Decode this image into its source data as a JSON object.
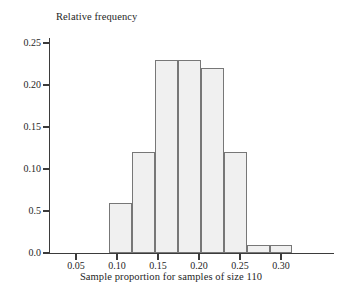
{
  "chart_data": {
    "type": "bar",
    "title": "",
    "xlabel": "Sample proportion for samples of size 110",
    "ylabel": "Relative frequency",
    "xlim": [
      0.035,
      0.318
    ],
    "ylim": [
      0.0,
      0.257
    ],
    "grid": false,
    "legend": null,
    "bin_width": 0.028,
    "bin_starts": [
      0.09,
      0.118,
      0.146,
      0.174,
      0.202,
      0.23,
      0.258,
      0.286
    ],
    "categories": [
      "0.090-0.118",
      "0.118-0.146",
      "0.146-0.174",
      "0.174-0.202",
      "0.202-0.230",
      "0.230-0.258",
      "0.258-0.286",
      "0.286-0.314"
    ],
    "values": [
      0.06,
      0.12,
      0.23,
      0.23,
      0.22,
      0.12,
      0.01,
      0.01
    ],
    "xticks": [
      0.05,
      0.1,
      0.15,
      0.2,
      0.25,
      0.3
    ],
    "xtick_labels": [
      "0.05",
      "0.10",
      "0.15",
      "0.20",
      "0.25",
      "0.30"
    ],
    "yticks": [
      0.0,
      0.05,
      0.1,
      0.15,
      0.2,
      0.25
    ],
    "ytick_labels": [
      "0.0",
      "0.5",
      "0.10",
      "0.15",
      "0.20",
      "0.25"
    ],
    "bar_fill_color": "#f0f0f0",
    "bar_edge_color": "#777777",
    "axis_color": "#3b3b3b"
  }
}
